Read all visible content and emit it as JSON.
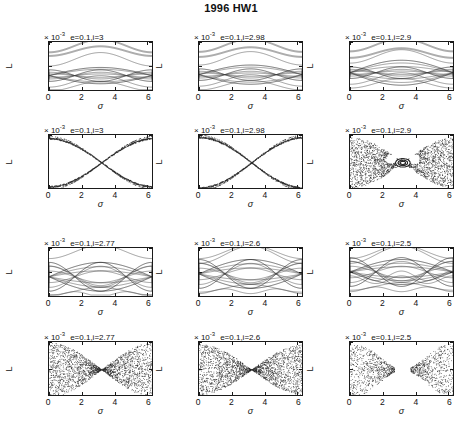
{
  "figure": {
    "title": "1996 HW1",
    "xlabel": "σ",
    "ylabel": "L",
    "exponent_label": "× 10",
    "exponent_value": "-3",
    "xticks": [
      "0",
      "2",
      "4",
      "6"
    ],
    "xlim": [
      0,
      6.2832
    ],
    "grid": false,
    "legend": "none"
  },
  "chart_data": {
    "type": "scatter",
    "title": "1996 HW1",
    "xlabel": "σ",
    "ylabel": "L",
    "scale": "1e-3",
    "panels": [
      {
        "id": "r1c1",
        "row": 1,
        "col": 1,
        "kind": "level-curves",
        "condition": "e=0.1,i=3",
        "e": 0.1,
        "i": 3,
        "yticks": [
          "1.285",
          "1.251",
          "1.217"
        ],
        "ylim": [
          1.217,
          1.285
        ],
        "xlim": [
          0,
          6.2832
        ]
      },
      {
        "id": "r1c2",
        "row": 1,
        "col": 2,
        "kind": "level-curves",
        "condition": "e=0.1,i=2.98",
        "e": 0.1,
        "i": 2.98,
        "yticks": [
          "1.29",
          "1.253",
          "1.216"
        ],
        "ylim": [
          1.216,
          1.29
        ],
        "xlim": [
          0,
          6.2832
        ]
      },
      {
        "id": "r1c3",
        "row": 1,
        "col": 3,
        "kind": "level-curves",
        "condition": "e=0.1,i=2.9",
        "e": 0.1,
        "i": 2.9,
        "yticks": [
          "1.295",
          "1.252",
          "1.209"
        ],
        "ylim": [
          1.209,
          1.295
        ],
        "xlim": [
          0,
          6.2832
        ]
      },
      {
        "id": "r2c1",
        "row": 2,
        "col": 1,
        "kind": "poincare-section",
        "condition": "e=0.1,i=3",
        "e": 0.1,
        "i": 3,
        "yticks": [
          "1.285",
          "1.245"
        ],
        "ylim": [
          1.245,
          1.285
        ],
        "xlim": [
          0,
          6.2832
        ]
      },
      {
        "id": "r2c2",
        "row": 2,
        "col": 2,
        "kind": "poincare-section",
        "condition": "e=0.1,i=2.98",
        "e": 0.1,
        "i": 2.98,
        "yticks": [
          "1.29",
          "1.24"
        ],
        "ylim": [
          1.24,
          1.29
        ],
        "xlim": [
          0,
          6.2832
        ]
      },
      {
        "id": "r2c3",
        "row": 2,
        "col": 3,
        "kind": "poincare-section",
        "condition": "e=0.1,i=2.9",
        "e": 0.1,
        "i": 2.9,
        "yticks": [
          "1.295",
          "1.225"
        ],
        "ylim": [
          1.225,
          1.295
        ],
        "xlim": [
          0,
          6.2832
        ]
      },
      {
        "id": "r3c1",
        "row": 3,
        "col": 1,
        "kind": "level-curves",
        "condition": "e=0.1,i=2.77",
        "e": 0.1,
        "i": 2.77,
        "yticks": [
          "1.3",
          "1.25",
          "1.2"
        ],
        "ylim": [
          1.2,
          1.3
        ],
        "xlim": [
          0,
          6.2832
        ]
      },
      {
        "id": "r3c2",
        "row": 3,
        "col": 2,
        "kind": "level-curves",
        "condition": "e=0.1,i=2.6",
        "e": 0.1,
        "i": 2.6,
        "yticks": [
          "1.32",
          "1.235",
          "1.15"
        ],
        "ylim": [
          1.15,
          1.32
        ],
        "xlim": [
          0,
          6.2832
        ]
      },
      {
        "id": "r3c3",
        "row": 3,
        "col": 3,
        "kind": "level-curves",
        "condition": "e=0.1,i=2.5",
        "e": 0.1,
        "i": 2.5,
        "yticks": [
          "1.32",
          "1.22",
          "1.12"
        ],
        "ylim": [
          1.12,
          1.32
        ],
        "xlim": [
          0,
          6.2832
        ]
      },
      {
        "id": "r4c1",
        "row": 4,
        "col": 1,
        "kind": "poincare-section",
        "condition": "e=0.1,i=2.77",
        "e": 0.1,
        "i": 2.77,
        "yticks": [
          "1.3",
          "1.25",
          "1.2"
        ],
        "ylim": [
          1.2,
          1.3
        ],
        "xlim": [
          0,
          6.2832
        ]
      },
      {
        "id": "r4c2",
        "row": 4,
        "col": 2,
        "kind": "poincare-section",
        "condition": "e=0.1,i=2.6",
        "e": 0.1,
        "i": 2.6,
        "yticks": [
          "1.32",
          "1.235",
          "1.15"
        ],
        "ylim": [
          1.15,
          1.32
        ],
        "xlim": [
          0,
          6.2832
        ]
      },
      {
        "id": "r4c3",
        "row": 4,
        "col": 3,
        "kind": "poincare-section",
        "condition": "e=0.1,i=2.5",
        "e": 0.1,
        "i": 2.5,
        "yticks": [
          "1.32",
          "1.22",
          "1.12"
        ],
        "ylim": [
          1.12,
          1.32
        ],
        "xlim": [
          0,
          6.2832
        ]
      }
    ]
  }
}
